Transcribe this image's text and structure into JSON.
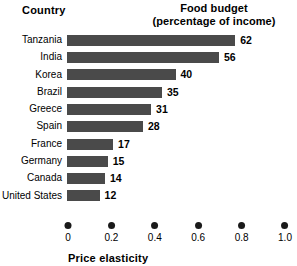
{
  "header": {
    "country_label": "Country",
    "budget_label_line1": "Food budget",
    "budget_label_line2": "(percentage of income)"
  },
  "axis": {
    "title": "Price elasticity",
    "tick_labels": [
      "0",
      "0.2",
      "0.4",
      "0.6",
      "0.8",
      "1.0"
    ]
  },
  "colors": {
    "bar": "#4a4a4a",
    "dot": "#1a1a1a",
    "background": "#ffffff",
    "text": "#000000"
  },
  "chart_data": {
    "type": "bar",
    "orientation": "horizontal",
    "title": "Food budget (percentage of income)",
    "xlabel": "Price elasticity",
    "ylabel": "Country",
    "categories": [
      "Tanzania",
      "India",
      "Korea",
      "Brazil",
      "Greece",
      "Spain",
      "France",
      "Germany",
      "Canada",
      "United States"
    ],
    "values": [
      62,
      56,
      40,
      35,
      31,
      28,
      17,
      15,
      14,
      12
    ],
    "value_unit": "percent of income",
    "xlim": [
      0,
      1.0
    ],
    "xticks": [
      0,
      0.2,
      0.4,
      0.6,
      0.8,
      1.0
    ],
    "grid": false,
    "legend": "none",
    "data_labels": [
      "62",
      "56",
      "40",
      "35",
      "31",
      "28",
      "17",
      "15",
      "14",
      "12"
    ],
    "bars": [
      {
        "country": "Tanzania",
        "value": 62,
        "label": "62",
        "elasticity": 0.78
      },
      {
        "country": "India",
        "value": 56,
        "label": "56",
        "elasticity": 0.7
      },
      {
        "country": "Korea",
        "value": 40,
        "label": "40",
        "elasticity": 0.5
      },
      {
        "country": "Brazil",
        "value": 35,
        "label": "35",
        "elasticity": 0.44
      },
      {
        "country": "Greece",
        "value": 31,
        "label": "31",
        "elasticity": 0.39
      },
      {
        "country": "Spain",
        "value": 28,
        "label": "28",
        "elasticity": 0.35
      },
      {
        "country": "France",
        "value": 17,
        "label": "17",
        "elasticity": 0.21
      },
      {
        "country": "Germany",
        "value": 15,
        "label": "15",
        "elasticity": 0.19
      },
      {
        "country": "Canada",
        "value": 14,
        "label": "14",
        "elasticity": 0.17
      },
      {
        "country": "United States",
        "value": 12,
        "label": "12",
        "elasticity": 0.15
      }
    ]
  }
}
